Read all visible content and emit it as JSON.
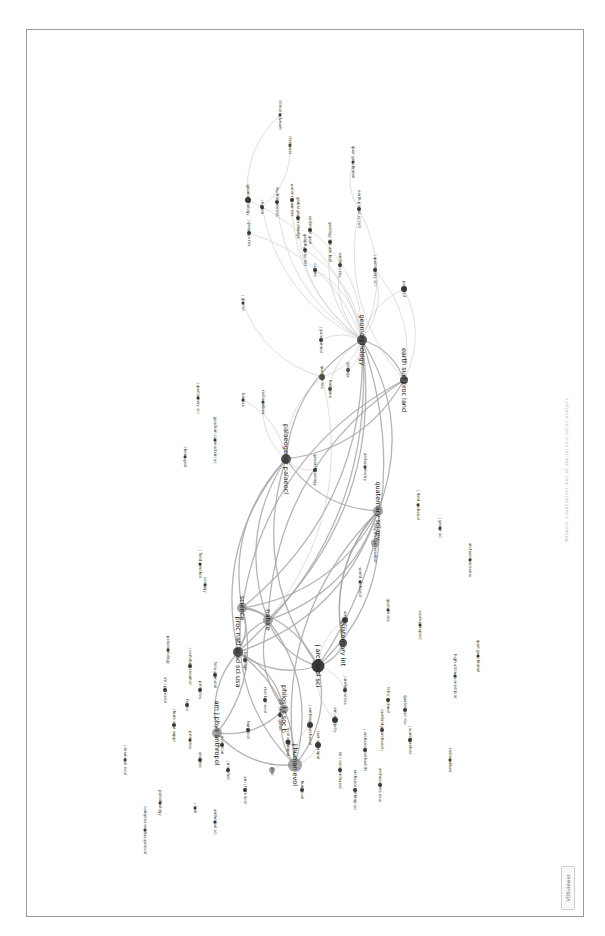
{
  "figure": {
    "caption": "Network visualization map of journal co-citation analysis",
    "software_badge": "VOSviewer",
    "orientation": "rotated 90° (landscape figure on portrait page)"
  },
  "colors": {
    "node": "#3a3a3a",
    "node_light": "#8a8a8a",
    "edge": "#bdbdbd",
    "frame": "#9a9a9a"
  },
  "nodes": [
    {
      "id": "n1",
      "label": "j human evol",
      "x": 295,
      "y": 765,
      "r": 7,
      "big": true,
      "tone": "light"
    },
    {
      "id": "n2",
      "label": "am j phys anthropol",
      "x": 217,
      "y": 733,
      "r": 5,
      "big": true,
      "tone": "light"
    },
    {
      "id": "n3",
      "label": "j archaeol sci",
      "x": 318,
      "y": 666,
      "r": 6.5,
      "big": true,
      "tone": "dark"
    },
    {
      "id": "n4",
      "label": "philos t r soc b",
      "x": 284,
      "y": 709,
      "r": 4.5,
      "big": true,
      "tone": "light"
    },
    {
      "id": "n5",
      "label": "proc natl acad sci usa",
      "x": 238,
      "y": 652,
      "r": 5,
      "big": true,
      "tone": "mid"
    },
    {
      "id": "n6",
      "label": "science",
      "x": 242,
      "y": 608,
      "r": 5,
      "big": true,
      "tone": "light"
    },
    {
      "id": "n7",
      "label": "nature",
      "x": 268,
      "y": 620,
      "r": 5,
      "big": true,
      "tone": "light"
    },
    {
      "id": "n8",
      "label": "quaternary sci rev",
      "x": 378,
      "y": 511,
      "r": 5,
      "big": true,
      "tone": "light"
    },
    {
      "id": "n9",
      "label": "palaeogeogr palaeocl",
      "x": 286,
      "y": 459,
      "r": 5,
      "big": true,
      "tone": "mid"
    },
    {
      "id": "n10",
      "label": "quaternary int",
      "x": 343,
      "y": 643,
      "r": 4,
      "big": true,
      "tone": "mid"
    },
    {
      "id": "n11",
      "label": "geomorphology",
      "x": 362,
      "y": 340,
      "r": 5,
      "big": true,
      "tone": "mid"
    },
    {
      "id": "n12",
      "label": "earth surf proc land",
      "x": 404,
      "y": 380,
      "r": 4,
      "big": true,
      "tone": "mid"
    },
    {
      "id": "n13",
      "label": "quatern res",
      "x": 322,
      "y": 377,
      "r": 3,
      "big": false,
      "tone": "mid"
    },
    {
      "id": "n14",
      "label": "holocene",
      "x": 330,
      "y": 389,
      "r": 2,
      "big": false,
      "tone": "mid"
    },
    {
      "id": "n15",
      "label": "geology",
      "x": 348,
      "y": 370,
      "r": 2,
      "big": false,
      "tone": "mid"
    },
    {
      "id": "n16",
      "label": "j quaternary sci",
      "x": 375,
      "y": 270,
      "r": 2,
      "big": false,
      "tone": "dark"
    },
    {
      "id": "n17",
      "label": "earth-sci rev",
      "x": 340,
      "y": 265,
      "r": 2,
      "big": false,
      "tone": "dark"
    },
    {
      "id": "n18",
      "label": "catena",
      "x": 315,
      "y": 270,
      "r": 2,
      "big": false,
      "tone": "dark"
    },
    {
      "id": "n19",
      "label": "geology soc am bull",
      "x": 330,
      "y": 242,
      "r": 2,
      "big": false,
      "tone": "dark"
    },
    {
      "id": "n20",
      "label": "sediment geol",
      "x": 310,
      "y": 230,
      "r": 2,
      "big": false,
      "tone": "dark"
    },
    {
      "id": "n21",
      "label": "global planet change",
      "x": 298,
      "y": 218,
      "r": 2,
      "big": false,
      "tone": "dark"
    },
    {
      "id": "n22",
      "label": "geophys res lett",
      "x": 305,
      "y": 250,
      "r": 2,
      "big": false,
      "tone": "dark"
    },
    {
      "id": "n23",
      "label": "water resour res",
      "x": 292,
      "y": 200,
      "r": 2,
      "big": false,
      "tone": "dark"
    },
    {
      "id": "n24",
      "label": "geomorphology",
      "x": 248,
      "y": 200,
      "r": 3,
      "big": false,
      "tone": "dark"
    },
    {
      "id": "n25",
      "label": "j hydrol",
      "x": 262,
      "y": 207,
      "r": 2,
      "big": false,
      "tone": "dark"
    },
    {
      "id": "n26",
      "label": "j geophys res",
      "x": 249,
      "y": 233,
      "r": 2,
      "big": false,
      "tone": "dark"
    },
    {
      "id": "n27",
      "label": "hydrol process",
      "x": 277,
      "y": 202,
      "r": 2,
      "big": false,
      "tone": "dark"
    },
    {
      "id": "n28",
      "label": "earth planet sc lett",
      "x": 359,
      "y": 209,
      "r": 2,
      "big": false,
      "tone": "dark"
    },
    {
      "id": "n29",
      "label": "climate dynam",
      "x": 280,
      "y": 115,
      "r": 1.5,
      "big": false,
      "tone": "dark"
    },
    {
      "id": "n30",
      "label": "clim past",
      "x": 290,
      "y": 145,
      "r": 1.5,
      "big": false,
      "tone": "dark"
    },
    {
      "id": "n31",
      "label": "quat geochronol",
      "x": 353,
      "y": 162,
      "r": 1.5,
      "big": false,
      "tone": "dark"
    },
    {
      "id": "n32",
      "label": "palaeo3",
      "x": 404,
      "y": 289,
      "r": 3,
      "big": false,
      "tone": "dark"
    },
    {
      "id": "n33",
      "label": "j paleolimnol",
      "x": 321,
      "y": 340,
      "r": 2,
      "big": false,
      "tone": "dark"
    },
    {
      "id": "n34",
      "label": "radiocarbon",
      "x": 263,
      "y": 402,
      "r": 1.5,
      "big": false,
      "tone": "dark"
    },
    {
      "id": "n35",
      "label": "boreas",
      "x": 243,
      "y": 400,
      "r": 1.5,
      "big": false,
      "tone": "dark"
    },
    {
      "id": "n36",
      "label": "j glaciol",
      "x": 243,
      "y": 303,
      "r": 1.5,
      "big": false,
      "tone": "dark"
    },
    {
      "id": "n37",
      "label": "geoarchaeology",
      "x": 315,
      "y": 470,
      "r": 2,
      "big": false,
      "tone": "dark"
    },
    {
      "id": "n38",
      "label": "archaeometry",
      "x": 365,
      "y": 467,
      "r": 1.5,
      "big": false,
      "tone": "dark"
    },
    {
      "id": "n39",
      "label": "veg hist archaeobot",
      "x": 375,
      "y": 543,
      "r": 4,
      "big": false,
      "tone": "light"
    },
    {
      "id": "n40",
      "label": "j field archaeol",
      "x": 418,
      "y": 505,
      "r": 1.5,
      "big": false,
      "tone": "dark"
    },
    {
      "id": "n41",
      "label": "world archaeol",
      "x": 360,
      "y": 582,
      "r": 1.5,
      "big": false,
      "tone": "dark"
    },
    {
      "id": "n42",
      "label": "antiquity",
      "x": 345,
      "y": 620,
      "r": 3,
      "big": false,
      "tone": "dark"
    },
    {
      "id": "n43",
      "label": "j anthropol archaeol",
      "x": 310,
      "y": 725,
      "r": 3,
      "big": false,
      "tone": "dark"
    },
    {
      "id": "n44",
      "label": "curr anthropol",
      "x": 318,
      "y": 745,
      "r": 3,
      "big": false,
      "tone": "dark"
    },
    {
      "id": "n45",
      "label": "evol anthropol",
      "x": 288,
      "y": 742,
      "r": 2.5,
      "big": false,
      "tone": "dark"
    },
    {
      "id": "n46",
      "label": "j anat",
      "x": 272,
      "y": 770,
      "r": 3,
      "big": false,
      "tone": "light"
    },
    {
      "id": "n47",
      "label": "am antiquity",
      "x": 335,
      "y": 720,
      "r": 3,
      "big": false,
      "tone": "dark"
    },
    {
      "id": "n48",
      "label": "quatern sci rev",
      "x": 405,
      "y": 710,
      "r": 2,
      "big": false,
      "tone": "dark"
    },
    {
      "id": "n49",
      "label": "cambridge archaeol j",
      "x": 382,
      "y": 730,
      "r": 2,
      "big": false,
      "tone": "dark"
    },
    {
      "id": "n50",
      "label": "j archaeol method th",
      "x": 365,
      "y": 750,
      "r": 2,
      "big": false,
      "tone": "dark"
    },
    {
      "id": "n51",
      "label": "int j osteoarchaeol",
      "x": 340,
      "y": 770,
      "r": 2,
      "big": false,
      "tone": "dark"
    },
    {
      "id": "n52",
      "label": "archaeol anthrop sci",
      "x": 355,
      "y": 790,
      "r": 2,
      "big": false,
      "tone": "dark"
    },
    {
      "id": "n53",
      "label": "am j hum biol",
      "x": 245,
      "y": 790,
      "r": 2,
      "big": false,
      "tone": "dark"
    },
    {
      "id": "n54",
      "label": "j morphol",
      "x": 228,
      "y": 770,
      "r": 2,
      "big": false,
      "tone": "dark"
    },
    {
      "id": "n55",
      "label": "anat rec",
      "x": 200,
      "y": 760,
      "r": 2,
      "big": false,
      "tone": "dark"
    },
    {
      "id": "n56",
      "label": "homo",
      "x": 187,
      "y": 705,
      "r": 2,
      "big": false,
      "tone": "dark"
    },
    {
      "id": "n57",
      "label": "j hum evol suppl",
      "x": 174,
      "y": 725,
      "r": 2,
      "big": false,
      "tone": "dark"
    },
    {
      "id": "n58",
      "label": "int j primatol",
      "x": 165,
      "y": 690,
      "r": 2,
      "big": false,
      "tone": "dark"
    },
    {
      "id": "n59",
      "label": "primates",
      "x": 200,
      "y": 690,
      "r": 2,
      "big": false,
      "tone": "dark"
    },
    {
      "id": "n60",
      "label": "folia primatol",
      "x": 215,
      "y": 675,
      "r": 2,
      "big": false,
      "tone": "dark"
    },
    {
      "id": "n61",
      "label": "j vertebr paleontol",
      "x": 190,
      "y": 666,
      "r": 2,
      "big": false,
      "tone": "dark"
    },
    {
      "id": "n62",
      "label": "palaeontology",
      "x": 168,
      "y": 650,
      "r": 1.5,
      "big": false,
      "tone": "dark"
    },
    {
      "id": "n63",
      "label": "j mammal evol",
      "x": 125,
      "y": 760,
      "r": 1.5,
      "big": false,
      "tone": "dark"
    },
    {
      "id": "n64",
      "label": "paleobiology",
      "x": 160,
      "y": 803,
      "r": 1.5,
      "big": false,
      "tone": "dark"
    },
    {
      "id": "n65",
      "label": "comptes rendus palevol",
      "x": 145,
      "y": 830,
      "r": 1.5,
      "big": false,
      "tone": "dark"
    },
    {
      "id": "n66",
      "label": "j zool",
      "x": 195,
      "y": 808,
      "r": 1.5,
      "big": false,
      "tone": "dark"
    },
    {
      "id": "n67",
      "label": "anthropol sci",
      "x": 215,
      "y": 822,
      "r": 1.5,
      "big": false,
      "tone": "dark"
    },
    {
      "id": "n68",
      "label": "archaeol oceania",
      "x": 470,
      "y": 560,
      "r": 1.5,
      "big": false,
      "tone": "dark"
    },
    {
      "id": "n69",
      "label": "high altitude med biol",
      "x": 455,
      "y": 676,
      "r": 1.5,
      "big": false,
      "tone": "dark"
    },
    {
      "id": "n70",
      "label": "quat geochronol",
      "x": 478,
      "y": 656,
      "r": 1.5,
      "big": false,
      "tone": "dark"
    },
    {
      "id": "n71",
      "label": "j geogr sci",
      "x": 440,
      "y": 528,
      "r": 1.5,
      "big": false,
      "tone": "dark"
    },
    {
      "id": "n72",
      "label": "quatern res",
      "x": 388,
      "y": 610,
      "r": 1.5,
      "big": false,
      "tone": "dark"
    },
    {
      "id": "n73",
      "label": "asian perspect",
      "x": 420,
      "y": 625,
      "r": 1.5,
      "big": false,
      "tone": "dark"
    },
    {
      "id": "n74",
      "label": "j world prehist",
      "x": 410,
      "y": 740,
      "r": 2,
      "big": false,
      "tone": "dark"
    },
    {
      "id": "n75",
      "label": "archaeol res asia",
      "x": 380,
      "y": 785,
      "r": 2,
      "big": false,
      "tone": "dark"
    },
    {
      "id": "n76",
      "label": "radiocarbon",
      "x": 450,
      "y": 760,
      "r": 1.5,
      "big": false,
      "tone": "dark"
    },
    {
      "id": "n77",
      "label": "j field ornithol",
      "x": 200,
      "y": 564,
      "r": 1.5,
      "big": false,
      "tone": "dark"
    },
    {
      "id": "n78",
      "label": "ecology",
      "x": 205,
      "y": 585,
      "r": 1.5,
      "big": false,
      "tone": "dark"
    },
    {
      "id": "n79",
      "label": "j biogeogr",
      "x": 245,
      "y": 660,
      "r": 2,
      "big": false,
      "tone": "dark"
    },
    {
      "id": "n80",
      "label": "mol biol evol",
      "x": 265,
      "y": 700,
      "r": 2,
      "big": false,
      "tone": "dark"
    },
    {
      "id": "n81",
      "label": "am j hum genet",
      "x": 280,
      "y": 715,
      "r": 2,
      "big": false,
      "tone": "dark"
    },
    {
      "id": "n82",
      "label": "hum biol",
      "x": 248,
      "y": 730,
      "r": 2,
      "big": false,
      "tone": "dark"
    },
    {
      "id": "n83",
      "label": "j anthropol res",
      "x": 345,
      "y": 690,
      "r": 2,
      "big": false,
      "tone": "dark"
    },
    {
      "id": "n84",
      "label": "lithic technol",
      "x": 388,
      "y": 700,
      "r": 2,
      "big": false,
      "tone": "dark"
    },
    {
      "id": "n85",
      "label": "hum evol",
      "x": 302,
      "y": 790,
      "r": 2,
      "big": false,
      "tone": "dark"
    },
    {
      "id": "n86",
      "label": "evolution",
      "x": 222,
      "y": 745,
      "r": 2,
      "big": false,
      "tone": "dark"
    },
    {
      "id": "n87",
      "label": "primates",
      "x": 190,
      "y": 740,
      "r": 1.5,
      "big": false,
      "tone": "dark"
    },
    {
      "id": "n88",
      "label": "geochim cosmochim ac",
      "x": 215,
      "y": 440,
      "r": 1.5,
      "big": false,
      "tone": "dark"
    },
    {
      "id": "n89",
      "label": "chem geol",
      "x": 185,
      "y": 457,
      "r": 1.5,
      "big": false,
      "tone": "dark"
    },
    {
      "id": "n90",
      "label": "j quaternary sci",
      "x": 198,
      "y": 398,
      "r": 1.5,
      "big": false,
      "tone": "dark"
    }
  ],
  "edges": [
    [
      "n1",
      "n2"
    ],
    [
      "n1",
      "n3"
    ],
    [
      "n1",
      "n4"
    ],
    [
      "n1",
      "n5"
    ],
    [
      "n1",
      "n6"
    ],
    [
      "n1",
      "n7"
    ],
    [
      "n1",
      "n43"
    ],
    [
      "n1",
      "n44"
    ],
    [
      "n1",
      "n45"
    ],
    [
      "n1",
      "n46"
    ],
    [
      "n3",
      "n5"
    ],
    [
      "n3",
      "n6"
    ],
    [
      "n3",
      "n7"
    ],
    [
      "n3",
      "n8"
    ],
    [
      "n3",
      "n9"
    ],
    [
      "n3",
      "n10"
    ],
    [
      "n3",
      "n42"
    ],
    [
      "n3",
      "n47"
    ],
    [
      "n3",
      "n83"
    ],
    [
      "n5",
      "n6"
    ],
    [
      "n5",
      "n7"
    ],
    [
      "n5",
      "n8"
    ],
    [
      "n5",
      "n9"
    ],
    [
      "n5",
      "n11"
    ],
    [
      "n6",
      "n7"
    ],
    [
      "n6",
      "n8"
    ],
    [
      "n6",
      "n9"
    ],
    [
      "n6",
      "n11"
    ],
    [
      "n6",
      "n12"
    ],
    [
      "n7",
      "n8"
    ],
    [
      "n7",
      "n9"
    ],
    [
      "n7",
      "n11"
    ],
    [
      "n7",
      "n12"
    ],
    [
      "n7",
      "n13"
    ],
    [
      "n8",
      "n9"
    ],
    [
      "n8",
      "n11"
    ],
    [
      "n8",
      "n39"
    ],
    [
      "n8",
      "n10"
    ],
    [
      "n9",
      "n11"
    ],
    [
      "n9",
      "n12"
    ],
    [
      "n9",
      "n13"
    ],
    [
      "n9",
      "n37"
    ],
    [
      "n11",
      "n12"
    ],
    [
      "n11",
      "n16"
    ],
    [
      "n11",
      "n17"
    ],
    [
      "n11",
      "n18"
    ],
    [
      "n11",
      "n19"
    ],
    [
      "n11",
      "n20"
    ],
    [
      "n11",
      "n21"
    ],
    [
      "n11",
      "n22"
    ],
    [
      "n11",
      "n23"
    ],
    [
      "n11",
      "n24"
    ],
    [
      "n11",
      "n25"
    ],
    [
      "n11",
      "n26"
    ],
    [
      "n11",
      "n27"
    ],
    [
      "n11",
      "n28"
    ],
    [
      "n11",
      "n32"
    ],
    [
      "n11",
      "n33"
    ],
    [
      "n11",
      "n13"
    ],
    [
      "n11",
      "n14"
    ],
    [
      "n11",
      "n15"
    ],
    [
      "n12",
      "n32"
    ],
    [
      "n12",
      "n28"
    ],
    [
      "n12",
      "n16"
    ],
    [
      "n24",
      "n29"
    ],
    [
      "n25",
      "n30"
    ],
    [
      "n28",
      "n31"
    ],
    [
      "n2",
      "n4"
    ],
    [
      "n2",
      "n5"
    ],
    [
      "n4",
      "n5"
    ],
    [
      "n4",
      "n7"
    ],
    [
      "n10",
      "n42"
    ],
    [
      "n10",
      "n8"
    ],
    [
      "n3",
      "n11"
    ],
    [
      "n1",
      "n8"
    ],
    [
      "n2",
      "n6"
    ],
    [
      "n9",
      "n34"
    ],
    [
      "n9",
      "n35"
    ],
    [
      "n13",
      "n36"
    ]
  ]
}
